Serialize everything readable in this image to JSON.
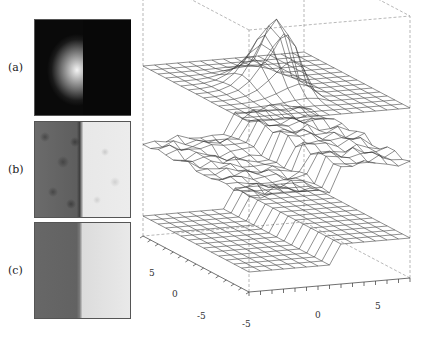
{
  "figure": {
    "panels": [
      {
        "id": "a",
        "label": "(a)",
        "description": "Dark image with bright half-disc blob on left-center"
      },
      {
        "id": "b",
        "label": "(b)",
        "description": "Noisy step edge: dark left half, bright right half"
      },
      {
        "id": "c",
        "label": "(c)",
        "description": "Smoothed step edge: dark left half, bright right half"
      }
    ],
    "plot3d": {
      "type": "wireframe-surfaces",
      "surfaces": [
        {
          "id": "top",
          "panel": "a",
          "description": "Flat plane with sharp peak near center"
        },
        {
          "id": "middle",
          "panel": "b",
          "description": "Noisy step surface"
        },
        {
          "id": "bottom",
          "panel": "c",
          "description": "Clean step surface"
        }
      ],
      "x_axis": {
        "ticks": [
          "-5",
          "0",
          "5"
        ]
      },
      "y_axis": {
        "ticks": [
          "-5",
          "0",
          "5"
        ]
      },
      "bounding_box": "dashed"
    }
  },
  "chart_data": {
    "type": "surface",
    "title": "",
    "x_ticks": [
      -5,
      0,
      5
    ],
    "y_ticks": [
      -5,
      0,
      5
    ],
    "xlim": [
      -7,
      7
    ],
    "ylim": [
      -7,
      7
    ],
    "series": [
      {
        "name": "(a) peak",
        "shape": "gaussian half-peak at center"
      },
      {
        "name": "(b) noisy step",
        "shape": "step along x=0 with noise"
      },
      {
        "name": "(c) smooth step",
        "shape": "step along x=0"
      }
    ]
  }
}
